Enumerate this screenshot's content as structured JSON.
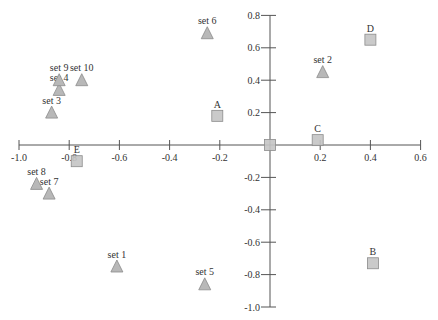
{
  "chart_data": {
    "type": "scatter",
    "title": "",
    "xlabel": "",
    "ylabel": "",
    "xlim": [
      -1.0,
      0.6
    ],
    "ylim": [
      -1.0,
      0.8
    ],
    "grid": false,
    "legend": null,
    "axes_cross_at_origin": true,
    "x_ticks": [
      "-1.0",
      "-0.8",
      "-0.6",
      "-0.4",
      "-0.2",
      "0.2",
      "0.4",
      "0.6"
    ],
    "x_tick_values": [
      -1.0,
      -0.8,
      -0.6,
      -0.4,
      -0.2,
      0.2,
      0.4,
      0.6
    ],
    "y_ticks": [
      "0.8",
      "0.6",
      "0.4",
      "0.2",
      "-0.2",
      "-0.4",
      "-0.6",
      "-0.8",
      "-1.0"
    ],
    "y_tick_values": [
      0.8,
      0.6,
      0.4,
      0.2,
      -0.2,
      -0.4,
      -0.6,
      -0.8,
      -1.0
    ],
    "series": [
      {
        "name": "sets",
        "marker": "triangle",
        "color": "#b8b8b8",
        "stroke": "#8c8c8c",
        "points": [
          {
            "label": "set 1",
            "x": -0.61,
            "y": -0.75
          },
          {
            "label": "set 2",
            "x": 0.21,
            "y": 0.45
          },
          {
            "label": "set 3",
            "x": -0.87,
            "y": 0.2
          },
          {
            "label": "set 4",
            "x": -0.84,
            "y": 0.34
          },
          {
            "label": "set 5",
            "x": -0.26,
            "y": -0.86
          },
          {
            "label": "set 6",
            "x": -0.25,
            "y": 0.69
          },
          {
            "label": "set 7",
            "x": -0.88,
            "y": -0.3
          },
          {
            "label": "set 8",
            "x": -0.93,
            "y": -0.24
          },
          {
            "label": "set 9",
            "x": -0.84,
            "y": 0.4
          },
          {
            "label": "set 10",
            "x": -0.75,
            "y": 0.4
          }
        ]
      },
      {
        "name": "categories",
        "marker": "square",
        "color": "#c4c4c4",
        "stroke": "#8c8c8c",
        "points": [
          {
            "label": "A",
            "x": -0.21,
            "y": 0.18
          },
          {
            "label": "B",
            "x": 0.41,
            "y": -0.73
          },
          {
            "label": "C",
            "x": 0.19,
            "y": 0.03
          },
          {
            "label": "D",
            "x": 0.4,
            "y": 0.65
          },
          {
            "label": "E",
            "x": -0.77,
            "y": -0.1
          },
          {
            "label": "",
            "x": 0.0,
            "y": 0.0
          }
        ]
      }
    ]
  },
  "plot_area": {
    "x_origin_px": 270,
    "y_origin_px": 145,
    "px_per_unit_x": 251,
    "px_per_unit_y": 162,
    "axis_color": "#555555"
  }
}
